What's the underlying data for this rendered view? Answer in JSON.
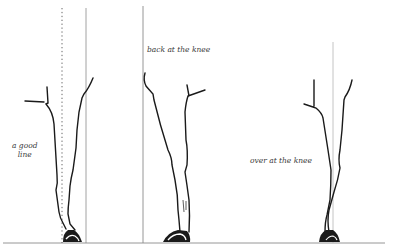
{
  "figure": {
    "colors": {
      "ink": "#1a1a1a",
      "plumb_line": "#7a7a7a",
      "ground": "#8a8a8a",
      "label": "#3a3a3a",
      "background": "#ffffff"
    },
    "panels": [
      {
        "id": "good-line",
        "label_lines": [
          "a good",
          "line"
        ],
        "plumb_lines": [
          "dotted center line",
          "solid vertical line"
        ]
      },
      {
        "id": "back-at-the-knee",
        "label": "back at the knee",
        "plumb_lines": [
          "solid vertical line"
        ]
      },
      {
        "id": "over-at-the-knee",
        "label": "over at the knee",
        "plumb_lines": [
          "light center line"
        ]
      }
    ],
    "ground_line": true
  }
}
